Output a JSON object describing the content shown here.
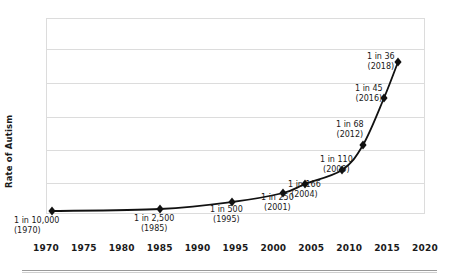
{
  "chart_data": {
    "type": "line",
    "title": "",
    "xlabel": "",
    "ylabel": "Rate of Autism",
    "xlim": [
      1970,
      2020
    ],
    "ylim": [
      0,
      1
    ],
    "grid": true,
    "legend": null,
    "x_ticks": [
      "1970",
      "1975",
      "1980",
      "1985",
      "1990",
      "1995",
      "2000",
      "2005",
      "2010",
      "2015",
      "2020"
    ],
    "y_ticks": [],
    "gridline_count": 5,
    "marker_shape": "diamond",
    "series": [
      {
        "name": "Rate of Autism",
        "color": "#111111",
        "points": [
          {
            "year": 1970,
            "rate_label": "1 in 10,000",
            "year_label": "(1970)",
            "denominator": 10000,
            "x_px": 52,
            "y_px": 211,
            "label_x": 14,
            "label_y": 216,
            "label_align": "left"
          },
          {
            "year": 1985,
            "rate_label": "1 in 2,500",
            "year_label": "(1985)",
            "denominator": 2500,
            "x_px": 160,
            "y_px": 209,
            "label_x": 134,
            "label_y": 214,
            "label_align": "center"
          },
          {
            "year": 1995,
            "rate_label": "1 in 500",
            "year_label": "(1995)",
            "denominator": 500,
            "x_px": 232,
            "y_px": 202,
            "label_x": 210,
            "label_y": 205,
            "label_align": "center"
          },
          {
            "year": 2001,
            "rate_label": "1 in 250",
            "year_label": "(2001)",
            "denominator": 250,
            "x_px": 283,
            "y_px": 193,
            "label_x": 261,
            "label_y": 193,
            "label_align": "center"
          },
          {
            "year": 2004,
            "rate_label": "1 in 166",
            "year_label": "(2004)",
            "denominator": 166,
            "x_px": 305,
            "y_px": 184,
            "label_x": 288,
            "label_y": 180,
            "label_align": "center"
          },
          {
            "year": 2009,
            "rate_label": "1 in 110",
            "year_label": "(2009)",
            "denominator": 110,
            "x_px": 342,
            "y_px": 170,
            "label_x": 320,
            "label_y": 155,
            "label_align": "center"
          },
          {
            "year": 2012,
            "rate_label": "1 in 68",
            "year_label": "(2012)",
            "denominator": 68,
            "x_px": 363,
            "y_px": 145,
            "label_x": 336,
            "label_y": 120,
            "label_align": "center"
          },
          {
            "year": 2016,
            "rate_label": "1 in 45",
            "year_label": "(2016)",
            "denominator": 45,
            "x_px": 384,
            "y_px": 98,
            "label_x": 355,
            "label_y": 84,
            "label_align": "center"
          },
          {
            "year": 2018,
            "rate_label": "1 in 36",
            "year_label": "(2018)",
            "denominator": 36,
            "x_px": 398,
            "y_px": 62,
            "label_x": 367,
            "label_y": 52,
            "label_align": "center"
          }
        ]
      }
    ]
  },
  "axis": {
    "y_title": "Rate of Autism"
  },
  "colors": {
    "line": "#111111",
    "marker": "#111111",
    "grid": "#dcdcdc",
    "frame": "#dcdcdc",
    "text": "#1a1a1a",
    "rule": "#9a9a9a",
    "background": "#ffffff"
  }
}
